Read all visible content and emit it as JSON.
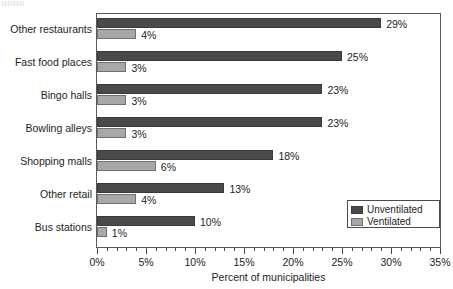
{
  "chart_data": {
    "type": "bar",
    "orientation": "horizontal",
    "title": "",
    "xlabel": "Percent of municipalities",
    "ylabel": "",
    "xlim": [
      0,
      35
    ],
    "xtick_labels": [
      "0%",
      "5%",
      "10%",
      "15%",
      "20%",
      "25%",
      "30%",
      "35%"
    ],
    "xtick_values": [
      0,
      5,
      10,
      15,
      20,
      25,
      30,
      35
    ],
    "minor_tick_step": 1,
    "grid": false,
    "legend_position": "bottom-right",
    "categories": [
      "Other restaurants",
      "Fast food places",
      "Bingo halls",
      "Bowling alleys",
      "Shopping malls",
      "Other retail",
      "Bus stations"
    ],
    "series": [
      {
        "name": "Unventilated",
        "color": "#4a4a4a",
        "values": [
          29,
          25,
          23,
          23,
          18,
          13,
          10
        ],
        "labels": [
          "29%",
          "25%",
          "23%",
          "23%",
          "18%",
          "13%",
          "10%"
        ]
      },
      {
        "name": "Ventilated",
        "color": "#a8a8a8",
        "values": [
          4,
          3,
          3,
          3,
          6,
          4,
          1
        ],
        "labels": [
          "4%",
          "3%",
          "3%",
          "3%",
          "6%",
          "4%",
          "1%"
        ]
      }
    ]
  },
  "legend": {
    "entries": [
      {
        "label": "Unventilated",
        "color": "#4a4a4a"
      },
      {
        "label": "Ventilated",
        "color": "#a8a8a8"
      }
    ]
  },
  "axis": {
    "x_title": "Percent of municipalities"
  }
}
